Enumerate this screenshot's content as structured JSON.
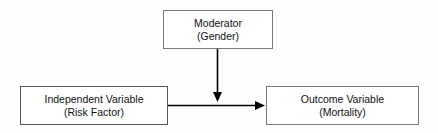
{
  "diagram": {
    "background_color": "#fefefe",
    "border_color": "#6b6b6b",
    "text_color": "#111111",
    "arrow_color": "#000000",
    "nodes": [
      {
        "id": "moderator",
        "line1": "Moderator",
        "line2": "(Gender)"
      },
      {
        "id": "independent",
        "line1": "Independent Variable",
        "line2": "(Risk Factor)"
      },
      {
        "id": "outcome",
        "line1": "Outcome Variable",
        "line2": "(Mortality)"
      }
    ],
    "edges": [
      {
        "id": "independent-to-outcome",
        "from": "independent",
        "to": "outcome",
        "label": "",
        "direction": "right"
      },
      {
        "id": "moderator-to-path",
        "from": "moderator",
        "to": "independent-to-outcome",
        "label": "",
        "direction": "down"
      }
    ]
  }
}
